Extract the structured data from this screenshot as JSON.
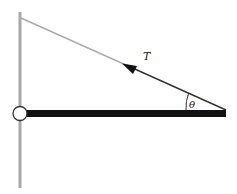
{
  "diagram": {
    "type": "physics-free-body",
    "labels": {
      "tension": "T",
      "angle": "θ"
    },
    "elements": {
      "wall": {
        "x": 20,
        "y1": 12,
        "y2": 188,
        "color": "#a8a8a8"
      },
      "string": {
        "x1": 21,
        "y1": 18,
        "x2": 226,
        "y2": 110,
        "color_far": "#aaaaaa",
        "color_near": "#333333"
      },
      "beam": {
        "x1": 20,
        "x2": 226,
        "y": 113.5,
        "thickness": 7,
        "color": "#111111"
      },
      "hinge": {
        "cx": 20,
        "cy": 114,
        "r": 7,
        "fill": "#ffffff",
        "stroke": "#333333"
      },
      "tension_arrow": {
        "tip_x": 127,
        "tip_y": 68,
        "direction": "up-left"
      },
      "angle_arc": {
        "cx": 226,
        "cy": 110,
        "r": 40
      }
    }
  }
}
